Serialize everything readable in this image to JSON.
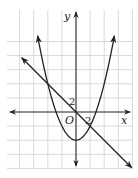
{
  "diagram": {
    "type": "coordinate-graph",
    "axes": {
      "x_label": "x",
      "y_label": "y",
      "origin_label": "O",
      "x_tick_label": "2",
      "y_tick_label": "2",
      "tick_value_per_grid": 2
    },
    "curves": [
      {
        "name": "parabola",
        "equation": "y = x^2/2 - 4",
        "vertex": [
          0,
          -4
        ]
      },
      {
        "name": "line",
        "equation": "y = -x"
      }
    ],
    "intersections": [
      [
        -4,
        4
      ],
      [
        2,
        -2
      ]
    ],
    "colors": {
      "grid": "#cfcfcf",
      "curve": "#222222",
      "axis": "#333333",
      "background": "#ffffff"
    }
  }
}
